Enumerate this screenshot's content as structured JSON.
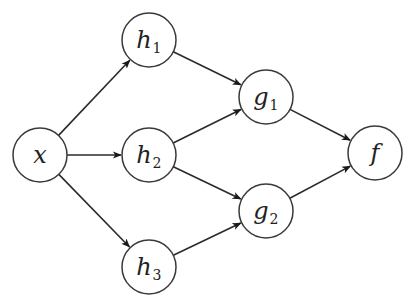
{
  "diagram": {
    "type": "directed-graph",
    "nodes": [
      {
        "id": "x",
        "label": "x",
        "sub": "",
        "cx": 40,
        "cy": 155
      },
      {
        "id": "h1",
        "label": "h",
        "sub": "1",
        "cx": 149,
        "cy": 40
      },
      {
        "id": "h2",
        "label": "h",
        "sub": "2",
        "cx": 149,
        "cy": 155
      },
      {
        "id": "h3",
        "label": "h",
        "sub": "3",
        "cx": 149,
        "cy": 267
      },
      {
        "id": "g1",
        "label": "g",
        "sub": "1",
        "cx": 266,
        "cy": 97
      },
      {
        "id": "g2",
        "label": "g",
        "sub": "2",
        "cx": 266,
        "cy": 211
      },
      {
        "id": "f",
        "label": "f",
        "sub": "",
        "cx": 375,
        "cy": 153
      }
    ],
    "edges": [
      {
        "from": "x",
        "to": "h1"
      },
      {
        "from": "x",
        "to": "h2"
      },
      {
        "from": "x",
        "to": "h3"
      },
      {
        "from": "h1",
        "to": "g1"
      },
      {
        "from": "h2",
        "to": "g1"
      },
      {
        "from": "h2",
        "to": "g2"
      },
      {
        "from": "h3",
        "to": "g2"
      },
      {
        "from": "g1",
        "to": "f"
      },
      {
        "from": "g2",
        "to": "f"
      }
    ],
    "node_radius": 27,
    "colors": {
      "stroke": "#2a2a2a",
      "fill": "#ffffff",
      "background": "#ffffff"
    }
  }
}
